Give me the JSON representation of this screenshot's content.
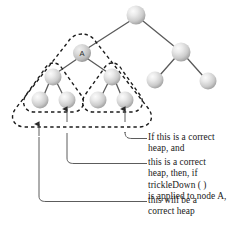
{
  "figure": {
    "node_label_a": "A",
    "colors": {
      "node_light": "#f4f4f4",
      "node_mid": "#c9c9c9",
      "node_dark": "#9a9a9a",
      "edge": "#5a5a5a",
      "dashed_outline": "#1c1c1c",
      "leader_line": "#4a4a4a",
      "text": "#1a1a1a",
      "background": "#ffffff"
    },
    "annotations": [
      {
        "id": "ann-1",
        "lines": [
          "If this is a correct",
          "heap, and"
        ]
      },
      {
        "id": "ann-2",
        "lines": [
          "this is a correct",
          "heap, then, if",
          "trickleDown ( )",
          "is applied to node A,"
        ]
      },
      {
        "id": "ann-3",
        "lines": [
          "this will be a",
          "correct heap"
        ]
      }
    ],
    "annotation_lines_flat": [
      "If this is a correct",
      "heap, and",
      "this is a correct",
      "heap, then, if",
      "trickleDown ( )",
      "is applied to node A,",
      "this will be a",
      "correct heap"
    ],
    "tree": {
      "nodes": [
        {
          "id": "root",
          "cx": 136,
          "cy": 15,
          "r": 9.5,
          "label": ""
        },
        {
          "id": "A",
          "cx": 82,
          "cy": 53,
          "r": 9.0,
          "label": "A"
        },
        {
          "id": "r1",
          "cx": 181,
          "cy": 52,
          "r": 9.5,
          "label": ""
        },
        {
          "id": "a-l",
          "cx": 53,
          "cy": 77,
          "r": 8.5,
          "label": ""
        },
        {
          "id": "a-r",
          "cx": 112,
          "cy": 77,
          "r": 8.5,
          "label": ""
        },
        {
          "id": "r1-l",
          "cx": 155,
          "cy": 80,
          "r": 8.5,
          "label": ""
        },
        {
          "id": "r1-r",
          "cx": 208,
          "cy": 81,
          "r": 8.5,
          "label": ""
        },
        {
          "id": "a-l-l",
          "cx": 40,
          "cy": 100,
          "r": 8.5,
          "label": ""
        },
        {
          "id": "a-l-r",
          "cx": 67,
          "cy": 100,
          "r": 8.5,
          "label": ""
        },
        {
          "id": "a-r-l",
          "cx": 98,
          "cy": 100,
          "r": 8.5,
          "label": ""
        },
        {
          "id": "a-r-r",
          "cx": 125,
          "cy": 100,
          "r": 8.5,
          "label": ""
        }
      ],
      "edges": [
        [
          "root",
          "A"
        ],
        [
          "root",
          "r1"
        ],
        [
          "A",
          "a-l"
        ],
        [
          "A",
          "a-r"
        ],
        [
          "r1",
          "r1-l"
        ],
        [
          "r1",
          "r1-r"
        ],
        [
          "a-l",
          "a-l-l"
        ],
        [
          "a-l",
          "a-l-r"
        ],
        [
          "a-r",
          "a-r-l"
        ],
        [
          "a-r",
          "a-r-r"
        ]
      ]
    }
  }
}
